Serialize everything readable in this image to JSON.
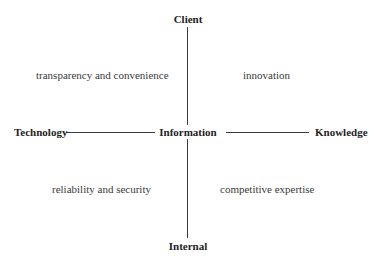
{
  "diagram": {
    "axes": {
      "top": "Client",
      "bottom": "Internal",
      "left": "Technology",
      "right": "Knowledge",
      "center": "Information"
    },
    "quadrants": {
      "top_left": "transparency and convenience",
      "top_right": "innovation",
      "bottom_left": "reliability and security",
      "bottom_right": "competitive expertise"
    },
    "colors": {
      "line": "#3a3a3a",
      "text": "#2a2a2a",
      "background": "#ffffff"
    }
  }
}
